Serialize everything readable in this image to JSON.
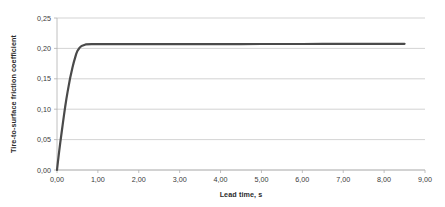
{
  "chart_data": {
    "type": "line",
    "title": "",
    "xlabel": "Lead time, s",
    "ylabel": "Tire-to-surface friction coefficient",
    "xlim": [
      0.0,
      9.0
    ],
    "ylim": [
      0.0,
      0.25
    ],
    "grid": "horizontal",
    "legend": "none",
    "x_tick_labels": [
      "0,00",
      "1,00",
      "2,00",
      "3,00",
      "4,00",
      "5,00",
      "6,00",
      "7,00",
      "8,00",
      "9,00"
    ],
    "x_tick_values": [
      0,
      1,
      2,
      3,
      4,
      5,
      6,
      7,
      8,
      9
    ],
    "y_tick_labels": [
      "0,00",
      "0,05",
      "0,10",
      "0,15",
      "0,20",
      "0,25"
    ],
    "y_tick_values": [
      0.0,
      0.05,
      0.1,
      0.15,
      0.2,
      0.25
    ],
    "decimal_separator": ",",
    "series": [
      {
        "name": "Tire-to-surface friction coefficient",
        "color": "#4a4a4a",
        "line_width": 2.2,
        "x": [
          0.0,
          0.02,
          0.05,
          0.08,
          0.11,
          0.14,
          0.17,
          0.2,
          0.23,
          0.26,
          0.29,
          0.32,
          0.35,
          0.38,
          0.41,
          0.44,
          0.47,
          0.5,
          0.55,
          0.6,
          0.7,
          0.85,
          1.0,
          1.5,
          2.0,
          2.5,
          3.0,
          3.5,
          4.0,
          4.5,
          5.0,
          5.5,
          6.0,
          6.5,
          7.0,
          7.5,
          8.0,
          8.3,
          8.5
        ],
        "y": [
          0.0,
          0.012,
          0.029,
          0.045,
          0.06,
          0.075,
          0.09,
          0.104,
          0.117,
          0.129,
          0.14,
          0.151,
          0.16,
          0.169,
          0.177,
          0.184,
          0.191,
          0.196,
          0.201,
          0.204,
          0.2065,
          0.207,
          0.207,
          0.207,
          0.207,
          0.207,
          0.207,
          0.2071,
          0.2071,
          0.2071,
          0.2072,
          0.2072,
          0.2072,
          0.2073,
          0.2073,
          0.2074,
          0.2074,
          0.2075,
          0.2075
        ]
      }
    ],
    "colors": {
      "series_line": "#4a4a4a",
      "gridline": "#c8c8c8",
      "axis_line": "#b0b0b0",
      "tick_text": "#3a3a3a",
      "title_text": "#2b2b2b",
      "plot_background": "#ffffff"
    },
    "annotations": {
      "plateau_value": 0.207,
      "rise_end_time": 0.5,
      "series_end_time": 8.5
    }
  }
}
